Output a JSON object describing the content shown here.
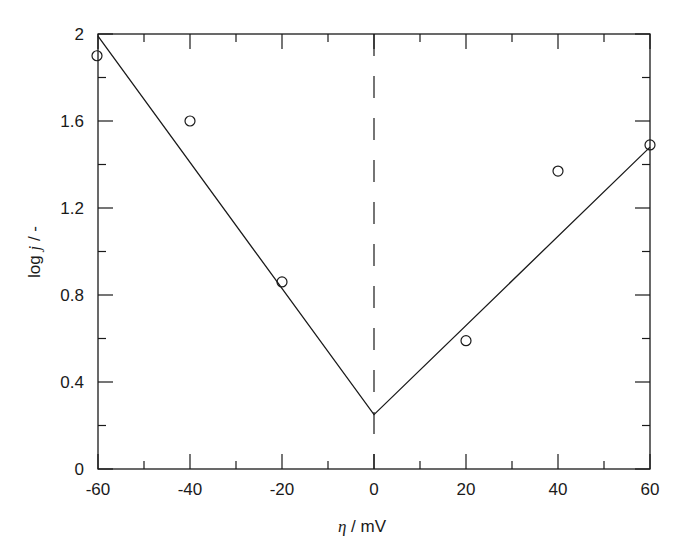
{
  "chart_data": {
    "type": "scatter",
    "title": "",
    "xlabel": "η / mV",
    "xlabel_parts": {
      "symbol": "η",
      "rest": " / mV"
    },
    "ylabel": "log j / -",
    "ylabel_parts": {
      "pre": "log ",
      "symbol": "j",
      "rest": " / -"
    },
    "xlim": [
      -60,
      60
    ],
    "ylim": [
      0,
      2
    ],
    "grid": false,
    "legend": null,
    "x_ticks_major": [
      -60,
      -40,
      -20,
      0,
      20,
      40,
      60
    ],
    "x_tick_labels": [
      "-60",
      "-40",
      "-20",
      "0",
      "20",
      "40",
      "60"
    ],
    "x_ticks_minor": [
      -50,
      -30,
      -10,
      10,
      30,
      50
    ],
    "y_ticks_major": [
      0,
      0.4,
      0.8,
      1.2,
      1.6,
      2
    ],
    "y_tick_labels": [
      "0",
      "0.4",
      "0.8",
      "1.2",
      "1.6",
      "2"
    ],
    "y_ticks_minor": [
      0.2,
      0.6,
      1.0,
      1.4,
      1.8
    ],
    "series": [
      {
        "name": "measured",
        "kind": "scatter",
        "marker": "open-circle",
        "x": [
          -60,
          -40,
          -20,
          20,
          40,
          60
        ],
        "y": [
          1.9,
          1.6,
          0.86,
          0.59,
          1.37,
          1.49
        ]
      },
      {
        "name": "fit",
        "kind": "line",
        "style": "solid",
        "x": [
          -60,
          0,
          60
        ],
        "y": [
          1.99,
          0.25,
          1.48
        ]
      },
      {
        "name": "zero-overpotential",
        "kind": "vline",
        "style": "dashed",
        "x": 0
      }
    ],
    "colors": {
      "ink": "#1a1a1a",
      "background": "#ffffff"
    }
  }
}
